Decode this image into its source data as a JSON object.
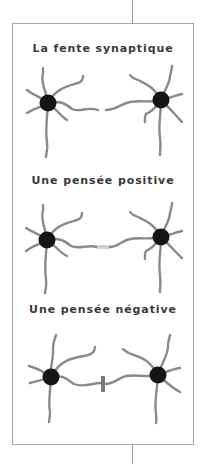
{
  "diagram": {
    "colors": {
      "frame": "#a8a8a8",
      "connector_line": "#9a9a9a",
      "title_text": "#3a3a3a",
      "dendrite": "#8a8a8a",
      "soma": "#151515",
      "positive_synapse": "#d0d0d0",
      "negative_blocker": "#7a7a7a"
    },
    "panels": [
      {
        "id": "synaptic-cleft",
        "title": "La fente synaptique",
        "synapse_state": "gap"
      },
      {
        "id": "positive-thought",
        "title": "Une pensée positive",
        "synapse_state": "connected"
      },
      {
        "id": "negative-thought",
        "title": "Une pensée négative",
        "synapse_state": "blocked"
      }
    ]
  }
}
